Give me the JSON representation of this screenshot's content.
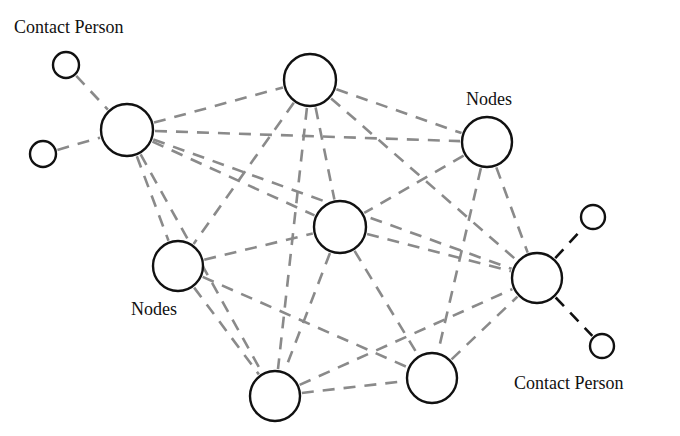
{
  "diagram": {
    "type": "network",
    "colors": {
      "node_stroke": "#111111",
      "node_fill": "#ffffff",
      "edge_gray": "#8a8a8a",
      "edge_black": "#111111",
      "text": "#111111"
    },
    "labels": [
      {
        "id": "label-contact-top-left",
        "text": "Contact Person",
        "x": 14,
        "y": 18
      },
      {
        "id": "label-nodes-top-right",
        "text": "Nodes",
        "x": 466,
        "y": 90
      },
      {
        "id": "label-nodes-left",
        "text": "Nodes",
        "x": 131,
        "y": 300
      },
      {
        "id": "label-contact-bottom-right",
        "text": "Contact Person",
        "x": 514,
        "y": 374
      }
    ],
    "nodes": [
      {
        "id": "n1",
        "role": "node",
        "x": 127,
        "y": 130,
        "r": 26
      },
      {
        "id": "n2",
        "role": "node",
        "x": 310,
        "y": 80,
        "r": 26
      },
      {
        "id": "n3",
        "role": "node",
        "x": 487,
        "y": 142,
        "r": 25
      },
      {
        "id": "n4",
        "role": "node",
        "x": 178,
        "y": 266,
        "r": 25
      },
      {
        "id": "n5",
        "role": "node",
        "x": 340,
        "y": 227,
        "r": 26
      },
      {
        "id": "n6",
        "role": "node",
        "x": 537,
        "y": 278,
        "r": 25
      },
      {
        "id": "n7",
        "role": "node",
        "x": 275,
        "y": 396,
        "r": 25
      },
      {
        "id": "n8",
        "role": "node",
        "x": 432,
        "y": 378,
        "r": 25
      },
      {
        "id": "c1",
        "role": "contact-person",
        "x": 66,
        "y": 65,
        "r": 13
      },
      {
        "id": "c2",
        "role": "contact-person",
        "x": 43,
        "y": 154,
        "r": 13
      },
      {
        "id": "c3",
        "role": "contact-person",
        "x": 593,
        "y": 217,
        "r": 12
      },
      {
        "id": "c4",
        "role": "contact-person",
        "x": 602,
        "y": 346,
        "r": 12
      }
    ],
    "edges": [
      {
        "from": "c1",
        "to": "n1",
        "style": "gray"
      },
      {
        "from": "c2",
        "to": "n1",
        "style": "gray"
      },
      {
        "from": "n6",
        "to": "c3",
        "style": "black"
      },
      {
        "from": "n6",
        "to": "c4",
        "style": "black"
      },
      {
        "from": "n1",
        "to": "n2",
        "style": "gray"
      },
      {
        "from": "n1",
        "to": "n3",
        "style": "gray"
      },
      {
        "from": "n1",
        "to": "n5",
        "style": "gray"
      },
      {
        "from": "n1",
        "to": "n4",
        "style": "gray"
      },
      {
        "from": "n1",
        "to": "n7",
        "style": "gray"
      },
      {
        "from": "n1",
        "to": "n6",
        "style": "gray"
      },
      {
        "from": "n2",
        "to": "n3",
        "style": "gray"
      },
      {
        "from": "n2",
        "to": "n4",
        "style": "gray"
      },
      {
        "from": "n2",
        "to": "n5",
        "style": "gray"
      },
      {
        "from": "n2",
        "to": "n7",
        "style": "gray"
      },
      {
        "from": "n2",
        "to": "n6",
        "style": "gray"
      },
      {
        "from": "n3",
        "to": "n5",
        "style": "gray"
      },
      {
        "from": "n3",
        "to": "n8",
        "style": "gray"
      },
      {
        "from": "n3",
        "to": "n6",
        "style": "gray"
      },
      {
        "from": "n4",
        "to": "n5",
        "style": "gray"
      },
      {
        "from": "n4",
        "to": "n7",
        "style": "gray"
      },
      {
        "from": "n4",
        "to": "n8",
        "style": "gray"
      },
      {
        "from": "n5",
        "to": "n7",
        "style": "gray"
      },
      {
        "from": "n5",
        "to": "n8",
        "style": "gray"
      },
      {
        "from": "n5",
        "to": "n6",
        "style": "gray"
      },
      {
        "from": "n7",
        "to": "n8",
        "style": "gray"
      },
      {
        "from": "n7",
        "to": "n6",
        "style": "gray"
      },
      {
        "from": "n8",
        "to": "n6",
        "style": "gray"
      }
    ]
  }
}
